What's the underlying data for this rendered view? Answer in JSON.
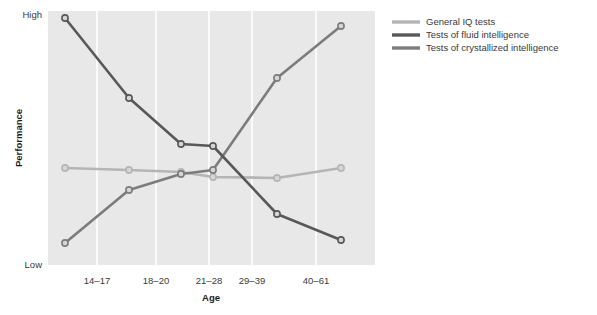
{
  "chart_data": {
    "type": "line",
    "title": "",
    "xlabel": "Age",
    "ylabel": "Performance",
    "categories": [
      "",
      "14–17",
      "18–20",
      "21–28",
      "29–39",
      "40–61"
    ],
    "tick_labels": [
      "14–17",
      "18–20",
      "21–28",
      "29–39",
      "40–61"
    ],
    "ylim": [
      0,
      100
    ],
    "ytick_labels": [
      "Low",
      "High"
    ],
    "grid": "vertical-white",
    "legend_position": "upper-right-outside",
    "series": [
      {
        "name": "General IQ tests",
        "color": "#b5b5b5",
        "values": [
          60,
          59,
          58,
          57,
          57.5,
          60.5
        ],
        "points_px": [
          [
            65,
            168
          ],
          [
            129,
            170
          ],
          [
            181,
            172
          ],
          [
            213,
            177
          ],
          [
            277,
            178
          ],
          [
            341,
            168
          ]
        ]
      },
      {
        "name": "Tests of fluid intelligence",
        "color": "#585858",
        "values": [
          97,
          66,
          48,
          47,
          20,
          10
        ],
        "points_px": [
          [
            65,
            18
          ],
          [
            129,
            98
          ],
          [
            181,
            144
          ],
          [
            213,
            146
          ],
          [
            277,
            214
          ],
          [
            341,
            240
          ]
        ]
      },
      {
        "name": "Tests of crystallized intelligence",
        "color": "#7c7c7c",
        "values": [
          9,
          52,
          60,
          62,
          80,
          95
        ],
        "points_px": [
          [
            65,
            243
          ],
          [
            129,
            190
          ],
          [
            181,
            174
          ],
          [
            213,
            170
          ],
          [
            277,
            78
          ],
          [
            341,
            26
          ]
        ]
      }
    ]
  },
  "axes": {
    "y_high_label": "High",
    "y_low_label": "Low",
    "y_title": "Performance",
    "x_title": "Age"
  },
  "legend": {
    "entries": [
      {
        "label": "General IQ tests",
        "color": "#b5b5b5"
      },
      {
        "label": "Tests of fluid intelligence",
        "color": "#585858"
      },
      {
        "label": "Tests of crystallized intelligence",
        "color": "#7c7c7c"
      }
    ]
  },
  "style": {
    "page_background": "#ffffff",
    "plot_background": "#e8e8e8",
    "gridline_color": "#ffffff",
    "marker_fill": "#d6d6d6",
    "text_color": "#3a3a3a"
  }
}
